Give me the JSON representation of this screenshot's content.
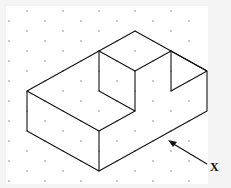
{
  "diagram": {
    "type": "isometric-drawing",
    "label": "X",
    "arrow_label": "X",
    "colors": {
      "line": "#111111",
      "dot": "#b0b0b0",
      "background": "#ffffff"
    }
  }
}
